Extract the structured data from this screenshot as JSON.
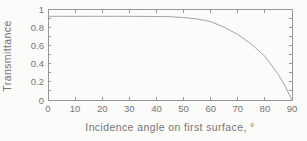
{
  "chart_data": {
    "type": "line",
    "title": "",
    "xlabel": "Incidence angle on first surface, °",
    "ylabel": "Transmittance",
    "xlim": [
      0,
      90
    ],
    "ylim": [
      0,
      1
    ],
    "x_ticks": [
      0,
      10,
      20,
      30,
      40,
      50,
      60,
      70,
      80,
      90
    ],
    "y_ticks": [
      0,
      0.2,
      0.4,
      0.6,
      0.8,
      1
    ],
    "y_tick_labels": [
      "0",
      "0.2",
      "0.4",
      "0.6",
      "0.8",
      "1"
    ],
    "y_minor_step": 0.1,
    "grid": false,
    "box": true,
    "legend": null,
    "series": [
      {
        "name": "transmittance-vs-incidence-angle",
        "x": [
          0,
          5,
          10,
          15,
          20,
          25,
          30,
          35,
          40,
          45,
          50,
          55,
          60,
          65,
          70,
          75,
          80,
          85,
          87.5,
          90
        ],
        "y": [
          0.92,
          0.92,
          0.92,
          0.92,
          0.92,
          0.92,
          0.92,
          0.919,
          0.918,
          0.915,
          0.905,
          0.89,
          0.862,
          0.8,
          0.72,
          0.615,
          0.48,
          0.28,
          0.15,
          0
        ]
      }
    ],
    "colors": {
      "background": "#fbfbf9",
      "axis": "#979797",
      "curve": "#a3a3a3",
      "text": "#757575"
    }
  }
}
